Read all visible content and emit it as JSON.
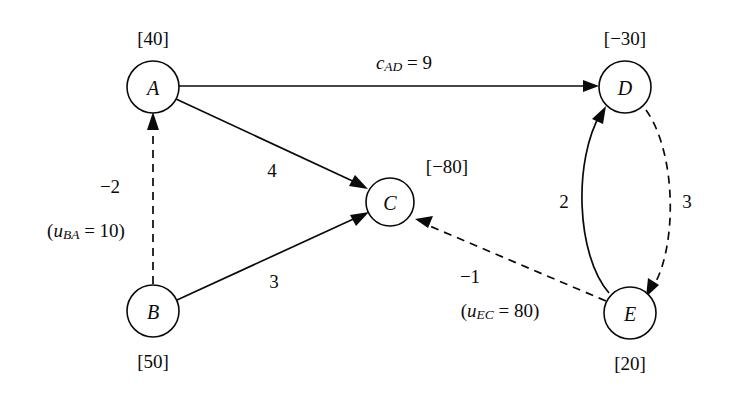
{
  "diagram": {
    "background_color": "#ffffff",
    "line_color": "#0a0a0a",
    "nodes": [
      {
        "id": "A",
        "label": "A",
        "supply": "[40]",
        "cx": 153,
        "cy": 87,
        "r": 26,
        "supply_x": 153,
        "supply_y": 38,
        "supply_pos": "above"
      },
      {
        "id": "B",
        "label": "B",
        "supply": "[50]",
        "cx": 153,
        "cy": 311,
        "r": 26,
        "supply_x": 153,
        "supply_y": 361,
        "supply_pos": "below"
      },
      {
        "id": "C",
        "label": "C",
        "supply": "[-80]",
        "cx": 390,
        "cy": 202,
        "r": 24,
        "supply_x": 447,
        "supply_y": 166,
        "supply_pos": "upper-right"
      },
      {
        "id": "D",
        "label": "D",
        "supply": "[-30]",
        "cx": 625,
        "cy": 87,
        "r": 26,
        "supply_x": 625,
        "supply_y": 38,
        "supply_pos": "above"
      },
      {
        "id": "E",
        "label": "E",
        "supply": "[20]",
        "cx": 630,
        "cy": 313,
        "r": 26,
        "supply_x": 630,
        "supply_y": 363,
        "supply_pos": "below"
      }
    ],
    "edges": [
      {
        "id": "A-D",
        "from": "A",
        "to": "D",
        "style": "solid",
        "shape": "line",
        "label": "c_AD = 9",
        "label_parts": {
          "var": "c",
          "sub": "AD",
          "rest": " = 9"
        },
        "label_x": 404,
        "label_y": 62
      },
      {
        "id": "A-C",
        "from": "A",
        "to": "C",
        "style": "solid",
        "shape": "line",
        "label": "4",
        "label_x": 272,
        "label_y": 170
      },
      {
        "id": "B-C",
        "from": "B",
        "to": "C",
        "style": "solid",
        "shape": "line",
        "label": "3",
        "label_x": 274,
        "label_y": 281
      },
      {
        "id": "E-D",
        "from": "E",
        "to": "D",
        "style": "solid",
        "shape": "curve",
        "label": "2",
        "label_x": 564,
        "label_y": 201
      },
      {
        "id": "B-A",
        "from": "B",
        "to": "A",
        "style": "dashed",
        "shape": "line",
        "label": "-2",
        "label_x": 110,
        "label_y": 186,
        "label2": "(u_BA = 10)",
        "label2_parts": {
          "pre": "(",
          "var": "u",
          "sub": "BA",
          "rest": " = 10)"
        },
        "label2_x": 86,
        "label2_y": 230
      },
      {
        "id": "D-E",
        "from": "D",
        "to": "E",
        "style": "dashed",
        "shape": "curve",
        "label": "3",
        "label_x": 687,
        "label_y": 201
      },
      {
        "id": "E-C",
        "from": "E",
        "to": "C",
        "style": "dashed",
        "shape": "line",
        "label": "-1",
        "label_x": 470,
        "label_y": 276,
        "label2": "(u_EC = 80)",
        "label2_parts": {
          "pre": "(",
          "var": "u",
          "sub": "EC",
          "rest": " = 80)"
        },
        "label2_x": 500,
        "label2_y": 310
      }
    ]
  }
}
